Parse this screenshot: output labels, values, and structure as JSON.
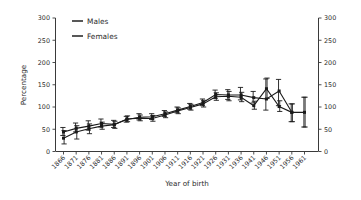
{
  "chart_data": {
    "type": "line",
    "title": "",
    "subtitle": "",
    "xlabel": "Year of birth",
    "ylabel": "Percentage",
    "xlim": [
      1866,
      1961
    ],
    "ylim": [
      0,
      300
    ],
    "yticks": [
      0,
      50,
      100,
      150,
      200,
      250,
      300
    ],
    "yticks_right": [
      0,
      50,
      100,
      150,
      200,
      250,
      300
    ],
    "grid": false,
    "legend_position": "top-left",
    "dual_y_axis": true,
    "error_bars": "95% CI",
    "categories": [
      1866,
      1871,
      1876,
      1881,
      1886,
      1891,
      1896,
      1901,
      1906,
      1911,
      1916,
      1921,
      1926,
      1931,
      1936,
      1941,
      1946,
      1951,
      1956,
      1961
    ],
    "series": [
      {
        "name": "Males",
        "values": [
          44,
          52,
          57,
          63,
          61,
          72,
          77,
          78,
          85,
          93,
          101,
          110,
          128,
          127,
          127,
          121,
          118,
          136,
          88,
          null
        ],
        "err_low": [
          36,
          44,
          48,
          55,
          54,
          66,
          71,
          72,
          79,
          87,
          95,
          103,
          119,
          117,
          116,
          109,
          93,
          103,
          67,
          55
        ],
        "err_high": [
          54,
          64,
          69,
          73,
          70,
          79,
          85,
          85,
          92,
          100,
          108,
          118,
          138,
          139,
          144,
          135,
          163,
          162,
          107,
          122
        ]
      },
      {
        "name": "Females",
        "values": [
          30,
          44,
          51,
          57,
          60,
          73,
          75,
          74,
          82,
          91,
          99,
          107,
          123,
          124,
          122,
          103,
          141,
          101,
          88,
          88
        ],
        "err_low": [
          17,
          28,
          40,
          50,
          52,
          67,
          69,
          68,
          76,
          85,
          93,
          100,
          115,
          114,
          112,
          95,
          119,
          90,
          67,
          55
        ],
        "err_high": [
          47,
          58,
          62,
          66,
          68,
          80,
          82,
          81,
          89,
          98,
          106,
          115,
          132,
          135,
          133,
          113,
          165,
          114,
          107,
          122
        ]
      }
    ]
  },
  "axes": {
    "ylabel": "Percentage",
    "xlabel": "Year of birth",
    "ytick_labels": [
      "300",
      "250",
      "200",
      "150",
      "100",
      "50",
      "0"
    ],
    "ytick_labels_right": [
      "300",
      "250",
      "200",
      "150",
      "100",
      "50",
      "0"
    ],
    "xtick_labels": [
      "1866",
      "1871",
      "1876",
      "1881",
      "1886",
      "1891",
      "1896",
      "1901",
      "1906",
      "1911",
      "1916",
      "1921",
      "1926",
      "1931",
      "1936",
      "1941",
      "1946",
      "1951",
      "1956",
      "1961"
    ]
  },
  "legend": {
    "items": [
      {
        "label": "Males"
      },
      {
        "label": "Females"
      }
    ]
  },
  "colors": {
    "series_line": "#1a1a1a",
    "axis": "#3a3a3a",
    "text": "#2b2b2b",
    "background": "#ffffff"
  }
}
